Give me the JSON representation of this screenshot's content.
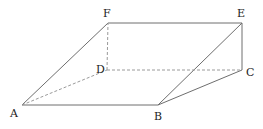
{
  "diagram": {
    "type": "geometric-solid",
    "colors": {
      "solid_edge": "#6e6e6e",
      "hidden_edge": "#9a9a9a",
      "label": "#222222"
    },
    "vertices": {
      "A": {
        "label": "A",
        "x": 22,
        "y": 105
      },
      "B": {
        "label": "B",
        "x": 158,
        "y": 105
      },
      "C": {
        "label": "C",
        "x": 242,
        "y": 70
      },
      "D": {
        "label": "D",
        "x": 107,
        "y": 70
      },
      "E": {
        "label": "E",
        "x": 242,
        "y": 23
      },
      "F": {
        "label": "F",
        "x": 108,
        "y": 23
      }
    },
    "solid_edges": [
      [
        "A",
        "B"
      ],
      [
        "A",
        "F"
      ],
      [
        "F",
        "E"
      ],
      [
        "E",
        "C"
      ],
      [
        "B",
        "C"
      ],
      [
        "B",
        "E"
      ]
    ],
    "hidden_edges": [
      [
        "A",
        "D"
      ],
      [
        "D",
        "C"
      ],
      [
        "D",
        "F"
      ]
    ]
  }
}
